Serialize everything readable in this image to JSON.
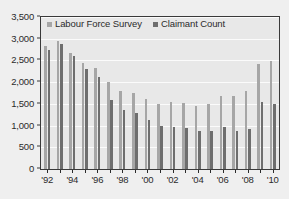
{
  "chart_data": {
    "type": "bar",
    "title": "",
    "subtitle": "",
    "xlabel": "",
    "ylabel": "",
    "ylim": [
      0,
      3500
    ],
    "ytick_values": [
      0,
      500,
      1000,
      1500,
      2000,
      2500,
      3000,
      3500
    ],
    "ytick_labels": [
      "0",
      "500",
      "1,000",
      "1,500",
      "2,000",
      "2,500",
      "3,000",
      "3,500"
    ],
    "grid": true,
    "legend_position": "top-inside",
    "categories": [
      "1992",
      "1993",
      "1994",
      "1995",
      "1996",
      "1997",
      "1998",
      "1999",
      "2000",
      "2001",
      "2002",
      "2003",
      "2004",
      "2005",
      "2006",
      "2007",
      "2008",
      "2009",
      "2010"
    ],
    "xtick_labels": [
      "'92",
      "'94",
      "'96",
      "'98",
      "'00",
      "'02",
      "'04",
      "'06",
      "'08",
      "'10"
    ],
    "xtick_categories": [
      "1992",
      "1994",
      "1996",
      "1998",
      "2000",
      "2002",
      "2004",
      "2006",
      "2008",
      "2010"
    ],
    "series": [
      {
        "name": "Labour Force Survey",
        "color": "#a6a6a6",
        "values": [
          2830,
          2950,
          2680,
          2450,
          2320,
          2010,
          1800,
          1750,
          1610,
          1490,
          1550,
          1520,
          1460,
          1490,
          1690,
          1680,
          1790,
          2410,
          2480
        ]
      },
      {
        "name": "Claimant Count",
        "color": "#6e6e6e",
        "values": [
          2750,
          2890,
          2610,
          2310,
          2110,
          1600,
          1370,
          1280,
          1130,
          980,
          960,
          950,
          870,
          880,
          960,
          880,
          930,
          1540,
          1500
        ]
      }
    ],
    "legend": [
      {
        "label": "Labour Force Survey",
        "color": "#a6a6a6"
      },
      {
        "label": "Claimant Count",
        "color": "#6e6e6e"
      }
    ],
    "colors": {
      "labour_force_survey": "#a6a6a6",
      "claimant_count": "#6e6e6e",
      "plot_background": "#e8e8e8",
      "figure_background": "#efefef",
      "axis": "#3a3a3a",
      "gridline": "#fbfbfb",
      "text": "#2b2b2b"
    }
  }
}
